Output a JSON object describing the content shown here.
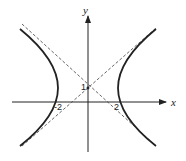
{
  "diagram": {
    "type": "hyperbola",
    "axes": {
      "x_label": "x",
      "y_label": "y"
    },
    "tick_labels": {
      "neg_x": "-2",
      "pos_x": "2",
      "y_center": "1"
    },
    "center": [
      0,
      1
    ],
    "vertices": [
      [
        -2,
        1
      ],
      [
        2,
        1
      ]
    ],
    "asymptotes": "dashed lines through center (0, 1)",
    "colors": {
      "curve": "#222222",
      "axes": "#222222",
      "asymptote": "#555555"
    }
  }
}
